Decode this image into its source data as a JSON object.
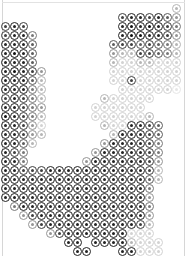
{
  "figure": {
    "title": "",
    "background_color": "#ffffff",
    "frame_color": "#d6d6d6"
  },
  "chart_data": {
    "type": "heatmap",
    "title": "",
    "subtitle": "",
    "xlabel": "",
    "ylabel": "",
    "legend": [],
    "annotations": [],
    "grid": false,
    "marker": "ring-with-center-dot",
    "colormap": "grayscale",
    "value_range": [
      0,
      9
    ],
    "null_value": -1,
    "null_meaning": "empty / no marker drawn",
    "cell_pitch_px": 9,
    "origin_px": [
      5,
      8
    ],
    "marker_outer_diameter_px": 9,
    "marker_ring_thickness_px": 1.6,
    "marker_core_diameter_px": 3,
    "ncols": 20,
    "nrows": 28,
    "xlim": [
      0,
      20
    ],
    "ylim": [
      0,
      28
    ],
    "xtick_labels": [],
    "ytick_labels": [],
    "values": [
      [
        -1,
        -1,
        -1,
        -1,
        -1,
        -1,
        -1,
        -1,
        -1,
        -1,
        -1,
        -1,
        -1,
        -1,
        -1,
        -1,
        -1,
        -1,
        -1,
        3
      ],
      [
        -1,
        -1,
        -1,
        -1,
        -1,
        -1,
        -1,
        -1,
        -1,
        -1,
        -1,
        -1,
        -1,
        7,
        8,
        8,
        7,
        8,
        6,
        4
      ],
      [
        7,
        8,
        7,
        -1,
        -1,
        -1,
        -1,
        -1,
        -1,
        -1,
        -1,
        -1,
        -1,
        8,
        9,
        8,
        9,
        8,
        7,
        5
      ],
      [
        7,
        8,
        8,
        5,
        -1,
        -1,
        -1,
        -1,
        -1,
        -1,
        -1,
        -1,
        -1,
        8,
        9,
        9,
        8,
        8,
        7,
        4
      ],
      [
        8,
        8,
        8,
        6,
        -1,
        -1,
        -1,
        -1,
        -1,
        -1,
        -1,
        -1,
        6,
        7,
        7,
        6,
        7,
        6,
        5,
        3
      ],
      [
        8,
        9,
        8,
        6,
        -1,
        -1,
        -1,
        -1,
        -1,
        -1,
        -1,
        -1,
        4,
        3,
        3,
        7,
        7,
        6,
        5,
        3
      ],
      [
        8,
        8,
        8,
        6,
        -1,
        -1,
        -1,
        -1,
        -1,
        -1,
        -1,
        -1,
        3,
        2,
        2,
        3,
        3,
        2,
        2,
        2
      ],
      [
        8,
        9,
        8,
        7,
        4,
        -1,
        -1,
        -1,
        -1,
        -1,
        -1,
        -1,
        2,
        2,
        2,
        2,
        2,
        2,
        2,
        2
      ],
      [
        8,
        8,
        8,
        6,
        3,
        -1,
        -1,
        -1,
        -1,
        -1,
        -1,
        -1,
        2,
        2,
        7,
        2,
        2,
        2,
        2,
        2
      ],
      [
        8,
        8,
        8,
        5,
        3,
        -1,
        -1,
        -1,
        -1,
        -1,
        -1,
        -1,
        -1,
        2,
        2,
        2,
        2,
        2,
        2,
        1
      ],
      [
        7,
        8,
        7,
        5,
        3,
        -1,
        -1,
        -1,
        -1,
        -1,
        -1,
        3,
        2,
        2,
        2,
        2,
        2,
        -1,
        -1,
        -1
      ],
      [
        8,
        8,
        7,
        5,
        4,
        -1,
        -1,
        -1,
        -1,
        -1,
        2,
        2,
        2,
        2,
        2,
        2,
        -1,
        -1,
        -1,
        -1
      ],
      [
        9,
        8,
        7,
        5,
        3,
        -1,
        -1,
        -1,
        -1,
        -1,
        2,
        2,
        2,
        2,
        2,
        2,
        3,
        -1,
        -1,
        -1
      ],
      [
        8,
        8,
        7,
        4,
        2,
        -1,
        -1,
        -1,
        -1,
        -1,
        -1,
        3,
        2,
        2,
        8,
        8,
        7,
        6,
        -1,
        -1
      ],
      [
        8,
        8,
        7,
        4,
        3,
        -1,
        -1,
        -1,
        -1,
        -1,
        -1,
        -1,
        3,
        8,
        8,
        8,
        7,
        6,
        -1,
        -1
      ],
      [
        8,
        8,
        6,
        3,
        -1,
        -1,
        -1,
        -1,
        -1,
        -1,
        -1,
        4,
        8,
        8,
        8,
        8,
        7,
        5,
        -1,
        -1
      ],
      [
        8,
        7,
        5,
        -1,
        -1,
        -1,
        -1,
        -1,
        -1,
        -1,
        4,
        8,
        8,
        8,
        8,
        8,
        7,
        5,
        -1,
        -1
      ],
      [
        8,
        8,
        5,
        -1,
        -1,
        -1,
        -1,
        -1,
        -1,
        4,
        8,
        8,
        8,
        8,
        8,
        8,
        7,
        4,
        -1,
        -1
      ],
      [
        8,
        8,
        7,
        7,
        7,
        8,
        8,
        8,
        8,
        8,
        8,
        8,
        8,
        8,
        8,
        8,
        7,
        3,
        -1,
        -1
      ],
      [
        8,
        8,
        8,
        8,
        8,
        8,
        8,
        8,
        8,
        8,
        8,
        8,
        8,
        8,
        8,
        8,
        6,
        3,
        -1,
        -1
      ],
      [
        8,
        8,
        8,
        8,
        8,
        8,
        8,
        8,
        8,
        8,
        8,
        8,
        8,
        8,
        8,
        8,
        5,
        -1,
        -1,
        -1
      ],
      [
        8,
        8,
        8,
        8,
        8,
        8,
        8,
        8,
        8,
        8,
        8,
        8,
        8,
        8,
        8,
        8,
        4,
        -1,
        -1,
        -1
      ],
      [
        -1,
        5,
        8,
        8,
        8,
        8,
        8,
        8,
        8,
        8,
        8,
        8,
        8,
        8,
        8,
        8,
        5,
        -1,
        -1,
        -1
      ],
      [
        -1,
        -1,
        4,
        7,
        8,
        8,
        8,
        8,
        8,
        8,
        8,
        8,
        8,
        8,
        8,
        8,
        4,
        -1,
        -1,
        -1
      ],
      [
        -1,
        -1,
        -1,
        4,
        7,
        8,
        8,
        8,
        8,
        8,
        8,
        8,
        8,
        8,
        8,
        7,
        3,
        -1,
        -1,
        -1
      ],
      [
        -1,
        -1,
        -1,
        -1,
        -1,
        4,
        7,
        8,
        8,
        8,
        8,
        8,
        8,
        8,
        2,
        2,
        2,
        -1,
        -1,
        -1
      ],
      [
        -1,
        -1,
        -1,
        -1,
        -1,
        -1,
        -1,
        8,
        8,
        -1,
        8,
        8,
        8,
        8,
        3,
        2,
        2,
        2,
        -1,
        -1
      ],
      [
        -1,
        -1,
        -1,
        -1,
        -1,
        -1,
        -1,
        -1,
        8,
        8,
        -1,
        -1,
        -1,
        8,
        8,
        2,
        2,
        2,
        -1,
        -1
      ]
    ],
    "palette": {
      "0": "#f4f4f4",
      "1": "#e6e6e6",
      "2": "#d2d2d2",
      "3": "#b5b5b5",
      "4": "#959595",
      "5": "#787878",
      "6": "#5d5d5d",
      "7": "#3f3f3f",
      "8": "#232323",
      "9": "#101010"
    }
  }
}
